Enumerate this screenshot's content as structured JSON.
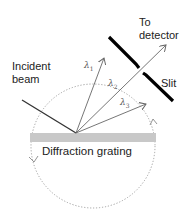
{
  "labels": {
    "incident_beam_line1": "Incident",
    "incident_beam_line2": "beam",
    "to_detector_line1": "To",
    "to_detector_line2": "detector",
    "slit": "Slit",
    "grating": "Diffraction grating",
    "lambda1": "λ",
    "lambda1_sub": "1",
    "lambda2": "λ",
    "lambda2_sub": "2",
    "lambda3": "λ",
    "lambda3_sub": "3"
  },
  "colors": {
    "grating": "#c8c8c8",
    "circle": "#a0a0a0",
    "rays": "#666666",
    "incident": "#333333",
    "slit": "#000000"
  }
}
